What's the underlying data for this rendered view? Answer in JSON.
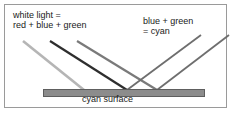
{
  "diagram": {
    "frame": {
      "border_color": "#9a9a9a",
      "background_color": "#ffffff"
    },
    "labels": {
      "incoming": "white light =\nred + blue + green",
      "outgoing": "blue + green\n= cyan",
      "surface": "cyan surface"
    },
    "surface": {
      "name": "cyan surface",
      "fill_color": "#8c8c8c",
      "border_color": "#5e5e5e"
    },
    "rays": {
      "incoming": [
        {
          "name": "red-ray",
          "color": "#b5b5b5",
          "component": "red"
        },
        {
          "name": "blue-ray",
          "color": "#2e2e2e",
          "component": "blue"
        },
        {
          "name": "green-ray",
          "color": "#7a7a7a",
          "component": "green"
        }
      ],
      "outgoing": [
        {
          "name": "blue-reflected-ray",
          "color": "#6e6e6e",
          "component": "blue"
        },
        {
          "name": "green-reflected-ray",
          "color": "#6e6e6e",
          "component": "green"
        }
      ]
    }
  }
}
